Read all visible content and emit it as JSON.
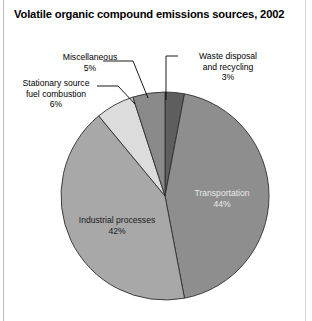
{
  "title": "Volatile organic compound emissions sources, 2002",
  "chart_data": {
    "type": "pie",
    "title": "Volatile organic compound emissions sources, 2002",
    "xlabel": "",
    "ylabel": "",
    "units": "percent",
    "legend_position": "none",
    "grid": false,
    "total": 100,
    "categories": [
      "Waste disposal and recycling",
      "Transportation",
      "Industrial processes",
      "Stationary source fuel combustion",
      "Miscellaneous"
    ],
    "values": [
      3,
      44,
      42,
      6,
      5
    ],
    "slices": [
      {
        "name": "Waste disposal and recycling",
        "label": "Waste disposal\nand recycling",
        "percent": 3,
        "percent_text": "3%",
        "color": "#5e5e5e",
        "label_placement": "callout"
      },
      {
        "name": "Transportation",
        "label": "Transportation",
        "percent": 44,
        "percent_text": "44%",
        "color": "#8e8e8e",
        "label_placement": "inside"
      },
      {
        "name": "Industrial processes",
        "label": "Industrial processes",
        "percent": 42,
        "percent_text": "42%",
        "color": "#a8a8a8",
        "label_placement": "inside"
      },
      {
        "name": "Stationary source fuel combustion",
        "label": "Stationary source\nfuel combustion",
        "percent": 6,
        "percent_text": "6%",
        "color": "#dcdcdc",
        "label_placement": "callout"
      },
      {
        "name": "Miscellaneous",
        "label": "Miscellaneous",
        "percent": 5,
        "percent_text": "5%",
        "color": "#8a8a8a",
        "label_placement": "callout"
      }
    ]
  },
  "callouts": {
    "miscellaneous": "Miscellaneous\n5%",
    "stationary": "Stationary source\nfuel combustion\n6%",
    "waste": "Waste disposal\nand recycling\n3%"
  },
  "inline_labels": {
    "transportation": "Transportation\n44%",
    "industrial": "Industrial processes\n42%"
  }
}
